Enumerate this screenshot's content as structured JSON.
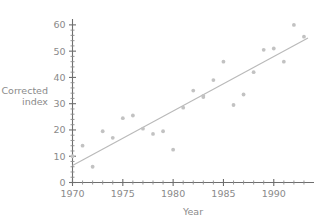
{
  "chart_data": {
    "type": "scatter",
    "title": "",
    "xlabel": "Year",
    "ylabel": "Corrected index",
    "ylabel_lines": [
      "Corrected",
      "index"
    ],
    "xlim": [
      1970,
      1993.6
    ],
    "ylim": [
      0,
      63
    ],
    "grid": false,
    "legend": null,
    "x_ticks": [
      1970,
      1975,
      1980,
      1985,
      1990
    ],
    "x_tick_labels": [
      "1970",
      "1975",
      "1980",
      "1985",
      "1990"
    ],
    "x_minor_step": 1,
    "y_ticks": [
      0,
      10,
      20,
      30,
      40,
      50,
      60
    ],
    "y_tick_labels": [
      "0",
      "10",
      "20",
      "30",
      "40",
      "50",
      "60"
    ],
    "y_minor_step": 2,
    "marker_color": "#c2c2c2",
    "line_color": "#b9b9b9",
    "axis_color": "#6e6e6e",
    "x": [
      1970,
      1971,
      1972,
      1973,
      1974,
      1975,
      1976,
      1977,
      1978,
      1979,
      1980,
      1981,
      1982,
      1983,
      1983,
      1984,
      1985,
      1986,
      1987,
      1988,
      1989,
      1990,
      1991,
      1992,
      1993
    ],
    "y": [
      10,
      14,
      6,
      19.5,
      17,
      24.5,
      25.5,
      20.5,
      18.5,
      19.5,
      12.5,
      28.5,
      35,
      32.5,
      33,
      39,
      46,
      29.5,
      33.5,
      42,
      50.5,
      51,
      46,
      60,
      55.5
    ],
    "points": [
      {
        "x": 1970,
        "y": 10
      },
      {
        "x": 1971,
        "y": 14
      },
      {
        "x": 1972,
        "y": 6
      },
      {
        "x": 1973,
        "y": 19.5
      },
      {
        "x": 1974,
        "y": 17
      },
      {
        "x": 1975,
        "y": 24.5
      },
      {
        "x": 1976,
        "y": 25.5
      },
      {
        "x": 1977,
        "y": 20.5
      },
      {
        "x": 1978,
        "y": 18.5
      },
      {
        "x": 1979,
        "y": 19.5
      },
      {
        "x": 1980,
        "y": 12.5
      },
      {
        "x": 1981,
        "y": 28.5
      },
      {
        "x": 1982,
        "y": 35
      },
      {
        "x": 1983,
        "y": 32.5
      },
      {
        "x": 1983,
        "y": 33
      },
      {
        "x": 1984,
        "y": 39
      },
      {
        "x": 1985,
        "y": 46
      },
      {
        "x": 1986,
        "y": 29.5
      },
      {
        "x": 1987,
        "y": 33.5
      },
      {
        "x": 1988,
        "y": 42
      },
      {
        "x": 1989,
        "y": 50.5
      },
      {
        "x": 1990,
        "y": 51
      },
      {
        "x": 1991,
        "y": 46
      },
      {
        "x": 1992,
        "y": 60
      },
      {
        "x": 1993,
        "y": 55.5
      }
    ],
    "trendline": {
      "type": "linear",
      "x_start": 1970,
      "y_start": 6.5,
      "x_end": 1993.4,
      "y_end": 55.0
    }
  }
}
